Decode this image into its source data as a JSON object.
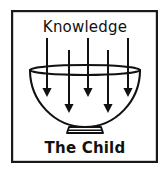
{
  "diagram": {
    "title_label": "Knowledge",
    "bottom_label": "The Child",
    "frame": {
      "x": 11,
      "y": 10,
      "width": 147,
      "height": 153,
      "stroke_color": "#1a1a1a"
    },
    "colors": {
      "ink": "#111111",
      "background": "#ffffff",
      "frame": "#1a1a1a"
    },
    "bowl": {
      "name": "bowl-shape",
      "rim_center_x": 85,
      "rim_center_y": 70,
      "rim_radius_x": 55,
      "rim_radius_y": 5,
      "depth_bottom_y": 128,
      "foot_label": "pedestal-foot"
    },
    "arrows": [
      {
        "id": "arrow-1",
        "x": 47,
        "y_start": 38,
        "y_end": 96
      },
      {
        "id": "arrow-2",
        "x": 69,
        "y_start": 50,
        "y_end": 112
      },
      {
        "id": "arrow-3",
        "x": 88,
        "y_start": 38,
        "y_end": 97
      },
      {
        "id": "arrow-4",
        "x": 108,
        "y_start": 50,
        "y_end": 112
      },
      {
        "id": "arrow-5",
        "x": 128,
        "y_start": 38,
        "y_end": 96
      }
    ],
    "arrow_count": 5,
    "meaning": {
      "source": "Knowledge",
      "target": "The Child",
      "direction": "downward"
    }
  }
}
